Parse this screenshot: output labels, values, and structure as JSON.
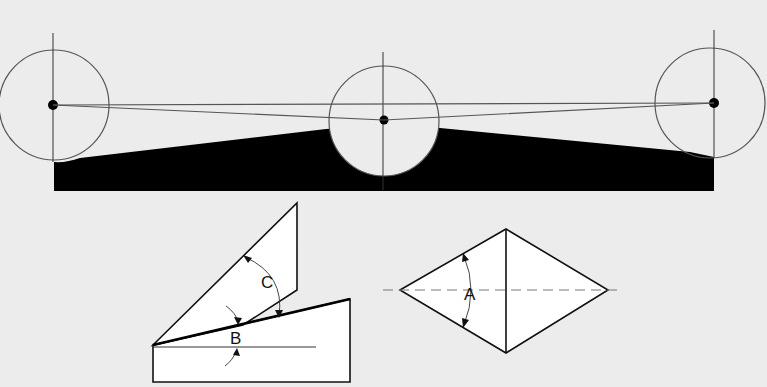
{
  "figure": {
    "colors": {
      "background": "#ececec",
      "line": "#222222",
      "thin_line": "#555555",
      "fill_dark": "#000000",
      "fill_light": "#ffffff"
    },
    "labels": {
      "angle_c": "C",
      "angle_b": "B",
      "angle_a": "A"
    }
  }
}
